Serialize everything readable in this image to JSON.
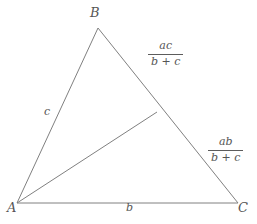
{
  "figure": {
    "background_color": "#ffffff",
    "stroke_color": "#808080",
    "text_color": "#555555"
  },
  "vertices": {
    "a_label": "A",
    "b_label": "B",
    "c_label": "C"
  },
  "sides": {
    "ab_label": "c",
    "ac_label": "b"
  },
  "segments": {
    "upper": {
      "numerator": "ac",
      "denominator": "b + c"
    },
    "lower": {
      "numerator": "ab",
      "denominator": "b + c"
    }
  },
  "geometry": {
    "type": "triangle-with-cevian",
    "points": {
      "A": [
        17,
        203
      ],
      "B": [
        98,
        28
      ],
      "C": [
        238,
        203
      ],
      "D": [
        157,
        112
      ]
    },
    "edges": [
      [
        "A",
        "B"
      ],
      [
        "B",
        "C"
      ],
      [
        "A",
        "C"
      ],
      [
        "A",
        "D"
      ]
    ]
  }
}
